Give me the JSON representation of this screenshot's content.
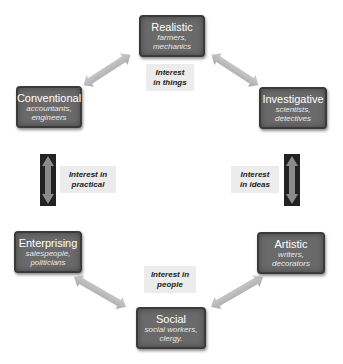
{
  "diagram": {
    "nodes": [
      {
        "id": "realistic",
        "title": "Realistic",
        "examples": "farmers, mechanics"
      },
      {
        "id": "investigative",
        "title": "Investigative",
        "examples": "scientists, detectives"
      },
      {
        "id": "artistic",
        "title": "Artistic",
        "examples": "writers, decorators"
      },
      {
        "id": "social",
        "title": "Social",
        "examples": "social workers, clergy"
      },
      {
        "id": "enterprising",
        "title": "Enterprising",
        "examples": "salespeople, politicians"
      },
      {
        "id": "conventional",
        "title": "Conventional",
        "examples": "accountants, engineers"
      }
    ],
    "realistic": {
      "title": "Realistic",
      "sub1": "farmers,",
      "sub2": "mechanics"
    },
    "investigative": {
      "title": "Investigative",
      "sub1": "scientists,",
      "sub2": "detectives"
    },
    "artistic": {
      "title": "Artistic",
      "sub1": "writers,",
      "sub2": "decorators"
    },
    "social": {
      "title": "Social",
      "sub1": "social workers,",
      "sub2": "clergy."
    },
    "enterprising": {
      "title": "Enterprising",
      "sub1": "salespeople,",
      "sub2": "politicians"
    },
    "conventional": {
      "title": "Conventional",
      "sub1": "accountants,",
      "sub2": "engineers"
    },
    "labels": {
      "things": {
        "line1": "Interest",
        "line2": "in things"
      },
      "practical": {
        "line1": "Interest in",
        "line2": "practical"
      },
      "ideas": {
        "line1": "Interest",
        "line2": "in ideas"
      },
      "people": {
        "line1": "Interest in",
        "line2": "people"
      }
    },
    "colors": {
      "box": "#6a6a6a",
      "box_border": "#3a3a3a",
      "arrow": "#b8b8b8",
      "vertical_arrow_bg": "#222222",
      "label_bg": "#ececec"
    }
  }
}
